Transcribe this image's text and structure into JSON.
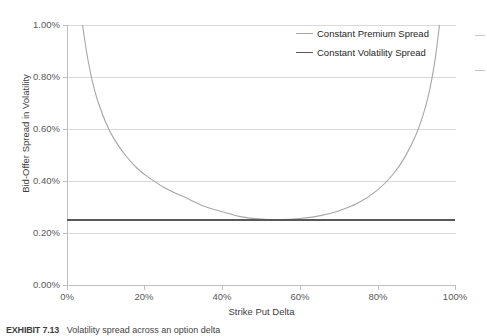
{
  "chart_data": {
    "type": "line",
    "title": "",
    "xlabel": "Strike Put Delta",
    "ylabel": "Bid-Offer Spread in Volatility",
    "xlim": [
      0,
      100
    ],
    "ylim": [
      0,
      1.0
    ],
    "xticks": [
      "0%",
      "20%",
      "40%",
      "60%",
      "80%",
      "100%"
    ],
    "xtick_values": [
      0,
      20,
      40,
      60,
      80,
      100
    ],
    "yticks": [
      "0.00%",
      "0.20%",
      "0.40%",
      "0.60%",
      "0.80%",
      "1.00%"
    ],
    "ytick_values": [
      0.0,
      0.2,
      0.4,
      0.6,
      0.8,
      1.0
    ],
    "grid": "horizontal",
    "legend_position": "top-right-inside",
    "series": [
      {
        "name": "Constant Premium Spread",
        "color": "#a6a6a6",
        "x": [
          4,
          5,
          6,
          7,
          8,
          10,
          12,
          15,
          18,
          20,
          25,
          30,
          35,
          40,
          45,
          50,
          55,
          60,
          65,
          70,
          75,
          80,
          84,
          87,
          90,
          92,
          93,
          94,
          95,
          96
        ],
        "values": [
          1.0,
          0.9,
          0.82,
          0.755,
          0.705,
          0.625,
          0.565,
          0.5,
          0.45,
          0.425,
          0.375,
          0.34,
          0.305,
          0.282,
          0.262,
          0.254,
          0.252,
          0.256,
          0.266,
          0.285,
          0.315,
          0.365,
          0.425,
          0.49,
          0.58,
          0.665,
          0.72,
          0.79,
          0.88,
          1.0
        ]
      },
      {
        "name": "Constant Volatility Spread",
        "color": "#595959",
        "x": [
          0,
          100
        ],
        "values": [
          0.25,
          0.25
        ]
      }
    ]
  },
  "legend": {
    "items": [
      {
        "label": "Constant Premium Spread",
        "color": "#a6a6a6"
      },
      {
        "label": "Constant Volatility Spread",
        "color": "#595959"
      }
    ]
  },
  "axes": {
    "y_title": "Bid-Offer Spread in Volatility",
    "x_title": "Strike Put Delta",
    "y_tick_labels": [
      "1.00%",
      "0.80%",
      "0.60%",
      "0.40%",
      "0.20%",
      "0.00%"
    ],
    "x_tick_labels": [
      "0%",
      "20%",
      "40%",
      "60%",
      "80%",
      "100%"
    ]
  },
  "caption": {
    "number": "EXHIBIT 7.13",
    "text": "Volatility spread across an option delta"
  }
}
